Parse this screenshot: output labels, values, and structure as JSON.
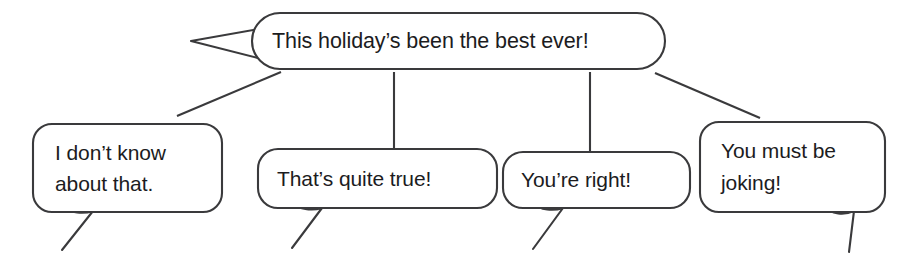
{
  "figure": {
    "type": "speech-bubble-diagram",
    "background_color": "#ffffff",
    "line_color": "#3a3a3c",
    "text_color": "#1c1c1e"
  },
  "main_bubble": {
    "name": "statement-bubble",
    "text": "This holiday’s been the best ever!",
    "tail_direction": "left"
  },
  "response_bubbles": [
    {
      "name": "response-bubble-1",
      "lines": [
        "I don’t know",
        "about that."
      ],
      "tail_direction": "down-left"
    },
    {
      "name": "response-bubble-2",
      "lines": [
        "That’s quite true!"
      ],
      "tail_direction": "down-left"
    },
    {
      "name": "response-bubble-3",
      "lines": [
        "You’re right!"
      ],
      "tail_direction": "down-left"
    },
    {
      "name": "response-bubble-4",
      "lines": [
        "You must be",
        "joking!"
      ],
      "tail_direction": "down-right"
    }
  ],
  "connectors": [
    {
      "name": "connector-left-diagonal",
      "style": "diagonal"
    },
    {
      "name": "connector-vertical-1",
      "style": "vertical"
    },
    {
      "name": "connector-vertical-2",
      "style": "vertical"
    },
    {
      "name": "connector-right-diagonal",
      "style": "diagonal"
    }
  ]
}
